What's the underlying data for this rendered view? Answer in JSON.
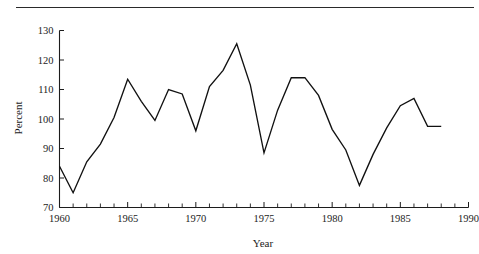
{
  "figure": {
    "top_rule": true,
    "clipped_caption_above_rule": ""
  },
  "chart_data": {
    "type": "line",
    "title": "",
    "xlabel": "Year",
    "ylabel": "Percent",
    "xlim": [
      1960,
      1990
    ],
    "ylim": [
      70,
      130
    ],
    "grid": false,
    "legend": null,
    "x_tick_labels": [
      "1960",
      "1965",
      "1970",
      "1975",
      "1980",
      "1985",
      "1990"
    ],
    "x_tick_values": [
      1960,
      1965,
      1970,
      1975,
      1980,
      1985,
      1990
    ],
    "x_minor_tick_step": 1,
    "y_tick_labels": [
      "70",
      "80",
      "90",
      "100",
      "110",
      "120",
      "130"
    ],
    "y_tick_values": [
      70,
      80,
      90,
      100,
      110,
      120,
      130
    ],
    "x": [
      1960,
      1961,
      1962,
      1963,
      1964,
      1965,
      1966,
      1967,
      1968,
      1969,
      1970,
      1971,
      1972,
      1973,
      1974,
      1975,
      1976,
      1977,
      1978,
      1979,
      1980,
      1981,
      1982,
      1983,
      1984,
      1985,
      1986,
      1987,
      1988
    ],
    "values": [
      84.0,
      75.0,
      85.5,
      91.5,
      100.5,
      113.5,
      106.0,
      99.5,
      110.0,
      108.5,
      96.0,
      111.0,
      116.5,
      125.5,
      111.5,
      88.5,
      103.0,
      114.0,
      114.0,
      108.0,
      96.5,
      89.5,
      77.5,
      88.0,
      97.0,
      104.5,
      107.0,
      97.5,
      97.5
    ],
    "series_color": "#111111",
    "line_width": 1.35,
    "markers": "none"
  }
}
